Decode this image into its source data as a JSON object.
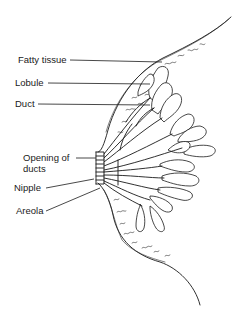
{
  "diagram": {
    "labels": [
      {
        "id": "fatty-tissue",
        "text": "Fatty tissue"
      },
      {
        "id": "lobule",
        "text": "Lobule"
      },
      {
        "id": "duct",
        "text": "Duct"
      },
      {
        "id": "opening-of-ducts",
        "text": "Opening of\nducts",
        "line1": "Opening of",
        "line2": "ducts"
      },
      {
        "id": "nipple",
        "text": "Nipple"
      },
      {
        "id": "areola",
        "text": "Areola"
      }
    ]
  }
}
